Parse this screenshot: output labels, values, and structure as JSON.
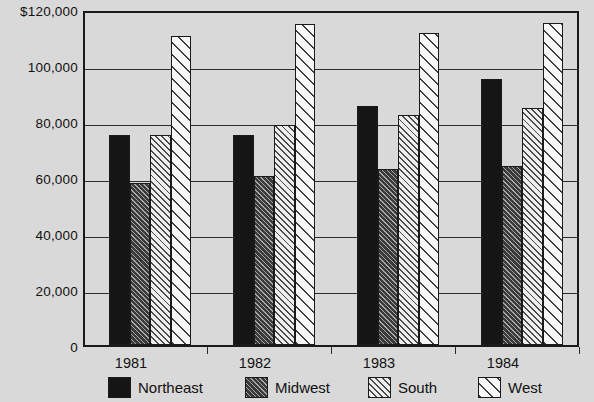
{
  "chart_data": {
    "type": "bar",
    "title": "",
    "xlabel": "",
    "ylabel": "",
    "categories": [
      "1981",
      "1982",
      "1983",
      "1984"
    ],
    "series": [
      {
        "name": "Northeast",
        "pattern": "solid-black",
        "values": [
          75000,
          75000,
          85500,
          95000
        ]
      },
      {
        "name": "Midwest",
        "pattern": "dark-hatch",
        "values": [
          58000,
          60500,
          63000,
          64000
        ]
      },
      {
        "name": "South",
        "pattern": "light-hatch",
        "values": [
          75000,
          78500,
          82000,
          84500
        ]
      },
      {
        "name": "West",
        "pattern": "wide-hatch",
        "values": [
          110500,
          114500,
          111500,
          115000
        ]
      }
    ],
    "ylim": [
      0,
      120000
    ],
    "ytick_values": [
      0,
      20000,
      40000,
      60000,
      80000,
      100000,
      120000
    ],
    "ytick_labels": [
      "0",
      "20,000",
      "40,000",
      "60,000",
      "80,000",
      "100,000",
      "$120,000"
    ],
    "grid": true,
    "legend_position": "bottom",
    "colors": {
      "background": "#d9d9d9",
      "axis": "#1a1a1a",
      "gridline": "#2b2b2b",
      "northeast": "#151515",
      "midwest": "#3a3a3a",
      "south": "#e8e8e8",
      "west": "#f5f5f5"
    }
  },
  "legend": {
    "items": [
      {
        "label": "Northeast"
      },
      {
        "label": "Midwest"
      },
      {
        "label": "South"
      },
      {
        "label": "West"
      }
    ]
  }
}
